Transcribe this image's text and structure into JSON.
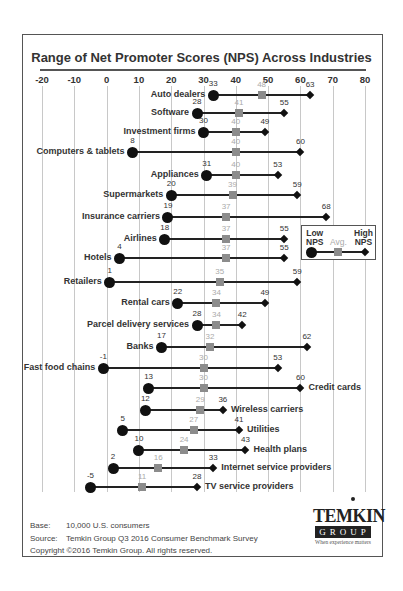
{
  "chart_data": {
    "type": "range-dot",
    "title": "Range of Net Promoter Scores (NPS) Across Industries",
    "xlabel": "",
    "ylabel": "",
    "xlim": [
      -20,
      80
    ],
    "x_ticks": [
      -20,
      -10,
      0,
      10,
      20,
      30,
      40,
      50,
      60,
      70,
      80
    ],
    "grid": true,
    "legend": {
      "position": "right-middle",
      "entries": [
        {
          "label": "Low NPS",
          "marker": "circle"
        },
        {
          "label": "Avg.",
          "marker": "square"
        },
        {
          "label": "High NPS",
          "marker": "diamond"
        }
      ]
    },
    "rows": [
      {
        "category": "Auto dealers",
        "low": 33,
        "avg": 48,
        "high": 63,
        "y": 95,
        "label_side": "left"
      },
      {
        "category": "Software",
        "low": 28,
        "avg": 41,
        "high": 55,
        "y": 113,
        "label_side": "left"
      },
      {
        "category": "Investment firms",
        "low": 30,
        "avg": 40,
        "high": 49,
        "y": 132,
        "label_side": "left"
      },
      {
        "category": "Computers & tablets",
        "low": 8,
        "avg": 40,
        "high": 60,
        "y": 152,
        "label_side": "left"
      },
      {
        "category": "Appliances",
        "low": 31,
        "avg": 40,
        "high": 53,
        "y": 175,
        "label_side": "left"
      },
      {
        "category": "Supermarkets",
        "low": 20,
        "avg": 39,
        "high": 59,
        "y": 195,
        "label_side": "left"
      },
      {
        "category": "Insurance carriers",
        "low": 19,
        "avg": 37,
        "high": 68,
        "y": 217,
        "label_side": "left"
      },
      {
        "category": "Airlines",
        "low": 18,
        "avg": 37,
        "high": 55,
        "y": 239,
        "label_side": "left"
      },
      {
        "category": "Hotels",
        "low": 4,
        "avg": 37,
        "high": 55,
        "y": 258,
        "label_side": "left"
      },
      {
        "category": "Retailers",
        "low": 1,
        "avg": 35,
        "high": 59,
        "y": 282,
        "label_side": "left"
      },
      {
        "category": "Rental cars",
        "low": 22,
        "avg": 34,
        "high": 49,
        "y": 303,
        "label_side": "left"
      },
      {
        "category": "Parcel delivery services",
        "low": 28,
        "avg": 34,
        "high": 42,
        "y": 325,
        "label_side": "left"
      },
      {
        "category": "Banks",
        "low": 17,
        "avg": 32,
        "high": 62,
        "y": 347,
        "label_side": "left"
      },
      {
        "category": "Fast food chains",
        "low": -1,
        "avg": 30,
        "high": 53,
        "y": 368,
        "label_side": "left"
      },
      {
        "category": "Credit cards",
        "low": 13,
        "avg": 30,
        "high": 60,
        "y": 388,
        "label_side": "right"
      },
      {
        "category": "Wireless carriers",
        "low": 12,
        "avg": 29,
        "high": 36,
        "y": 410,
        "label_side": "right"
      },
      {
        "category": "Utilities",
        "low": 5,
        "avg": 27,
        "high": 41,
        "y": 430,
        "label_side": "right"
      },
      {
        "category": "Health plans",
        "low": 10,
        "avg": 24,
        "high": 43,
        "y": 450,
        "label_side": "right"
      },
      {
        "category": "Internet service providers",
        "low": 2,
        "avg": 16,
        "high": 33,
        "y": 468,
        "label_side": "right"
      },
      {
        "category": "TV service providers",
        "low": -5,
        "avg": 11,
        "high": 28,
        "y": 487,
        "label_side": "right"
      }
    ]
  },
  "legend": {
    "low_line1": "Low",
    "low_line2": "NPS",
    "avg": "Avg.",
    "high_line1": "High",
    "high_line2": "NPS"
  },
  "footer": {
    "base_key": "Base:",
    "base_val": "10,000 U.S. consumers",
    "source_key": "Source:",
    "source_val": "Temkin Group Q3 2016 Consumer Benchmark Survey",
    "copyright": "Copyright ©2016 Temkin Group. All rights reserved."
  },
  "logo": {
    "word": "TEMKIN",
    "group": "GROUP",
    "tagline": "When experience matters"
  },
  "colors": {
    "low": "#111111",
    "avg": "#8c8c8c",
    "high": "#111111",
    "grid": "#c8c8c8",
    "avg_label": "#aaaaaa"
  }
}
